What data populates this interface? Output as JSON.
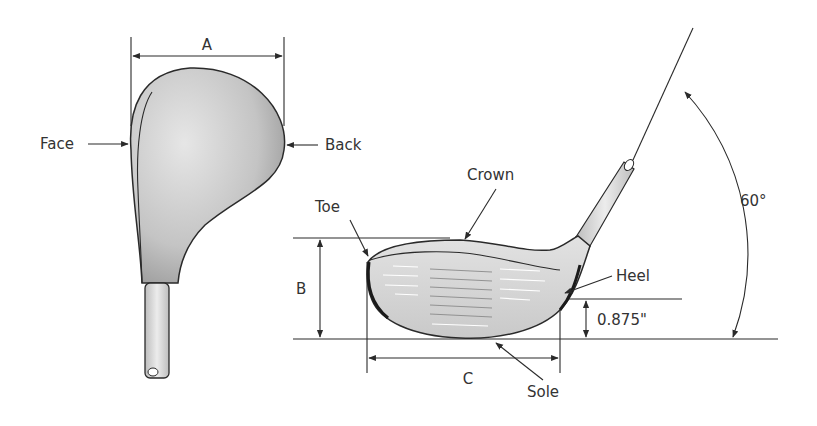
{
  "diagram": {
    "top_view": {
      "dimension_label": "A",
      "labels": {
        "face": "Face",
        "back": "Back"
      }
    },
    "side_view": {
      "labels": {
        "crown": "Crown",
        "toe": "Toe",
        "heel": "Heel",
        "sole": "Sole"
      },
      "dimensions": {
        "height": "B",
        "length": "C",
        "heel_height": "0.875\"",
        "lie_angle": "60°"
      }
    },
    "colors": {
      "line": "#2a2a2a",
      "head_fill_light": "#d9d9d9",
      "head_fill_dark": "#9a9a9a",
      "text": "#333333"
    }
  }
}
